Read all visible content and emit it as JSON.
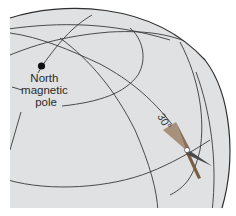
{
  "diagram": {
    "type": "globe-magnetic-inclination",
    "colors": {
      "globe_fill": "#dfe1e2",
      "grid_line": "#3a3a3a",
      "outline": "#2e2e2e",
      "pole_dot": "#111111",
      "needle_north": "#8a6e55",
      "needle_north_light": "#a8917a",
      "needle_south": "#4a4a4a",
      "needle_south_light": "#7d7f80",
      "pivot": "#ffffff"
    },
    "pole_label": {
      "line1": "North",
      "line2": "magnetic",
      "line3": "pole"
    },
    "inclination_label": "30°"
  }
}
